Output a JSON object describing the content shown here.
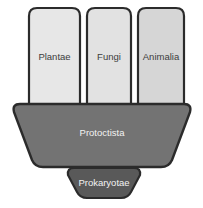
{
  "diagram": {
    "name": "five-kingdoms-classification",
    "background_color": "#ffffff",
    "outline_color": "#2b2b2b",
    "top_kingdoms": [
      {
        "id": "plantae",
        "label": "Plantae",
        "fill": "#e7e7e7",
        "text_color": "#3c3c3c",
        "x": 27,
        "y": 6,
        "width": 55,
        "height": 99
      },
      {
        "id": "fungi",
        "label": "Fungi",
        "fill": "#e2e2e2",
        "text_color": "#3c3c3c",
        "x": 85,
        "y": 6,
        "width": 48,
        "height": 99
      },
      {
        "id": "animalia",
        "label": "Animalia",
        "fill": "#d6d6d6",
        "text_color": "#3c3c3c",
        "x": 136,
        "y": 6,
        "width": 50,
        "height": 99
      }
    ],
    "middle_kingdom": {
      "id": "protoctista",
      "label": "Protoctista",
      "fill": "#737373",
      "text_color": "#f2f2f2",
      "shape": "trapezoid-narrowing-down",
      "top_left_x": 13,
      "top_right_x": 191,
      "bottom_left_x": 36,
      "bottom_right_x": 170,
      "top_y": 103,
      "bottom_y": 168
    },
    "bottom_kingdom": {
      "id": "prokaryotae",
      "label": "Prokaryotae",
      "fill": "#595959",
      "text_color": "#f2f2f2",
      "shape": "trapezoid-narrowing-down",
      "top_left_x": 68,
      "top_right_x": 140,
      "bottom_left_x": 80,
      "bottom_right_x": 128,
      "top_y": 167,
      "bottom_y": 199
    }
  }
}
